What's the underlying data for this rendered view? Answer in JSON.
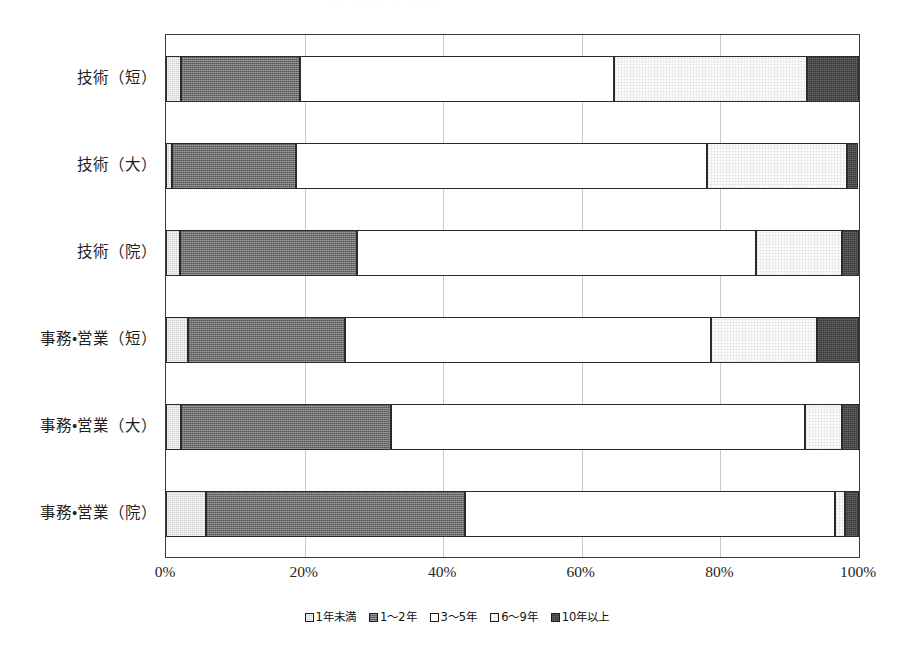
{
  "scan_artifact_text": "· · ·   ·· ·  ·· · ·· ·",
  "chart_data": {
    "type": "bar",
    "orientation": "horizontal",
    "stacked": true,
    "title": "",
    "subtitle": "",
    "xlabel": "",
    "ylabel": "",
    "xlim": [
      0,
      100
    ],
    "xtick_labels": [
      "0%",
      "20%",
      "40%",
      "60%",
      "80%",
      "100%"
    ],
    "xtick_values": [
      0,
      20,
      40,
      60,
      80,
      100
    ],
    "grid": true,
    "grid_axis": "x",
    "legend_position": "bottom",
    "unit": "%",
    "categories": [
      "技術（短）",
      "技術（大）",
      "技術（院）",
      "事務・営業（短）",
      "事務・営業（大）",
      "事務・営業（院）"
    ],
    "series": [
      {
        "name": "1年未満",
        "pattern": "light-grey-speckle",
        "color": "#d2d2d2",
        "values": [
          2.2,
          0.8,
          2.0,
          3.2,
          2.2,
          5.8
        ]
      },
      {
        "name": "1〜2年",
        "pattern": "dark-grey-speckle",
        "color": "#6e6e6e",
        "values": [
          17.1,
          17.9,
          25.6,
          22.6,
          30.3,
          37.4
        ]
      },
      {
        "name": "3〜5年",
        "pattern": "white",
        "color": "#ffffff",
        "values": [
          45.3,
          59.4,
          57.6,
          52.9,
          59.7,
          53.4
        ]
      },
      {
        "name": "6〜9年",
        "pattern": "dotted-near-white",
        "color": "#fbfbfb",
        "values": [
          27.9,
          20.1,
          12.4,
          15.3,
          5.4,
          1.4
        ]
      },
      {
        "name": "10年以上",
        "pattern": "near-black-speckle",
        "color": "#343434",
        "values": [
          7.5,
          1.7,
          2.4,
          6.0,
          2.4,
          2.0
        ]
      }
    ]
  },
  "axis": {
    "x_ticks": [
      {
        "label": "0%",
        "value": 0
      },
      {
        "label": "20%",
        "value": 20
      },
      {
        "label": "40%",
        "value": 40
      },
      {
        "label": "60%",
        "value": 60
      },
      {
        "label": "80%",
        "value": 80
      },
      {
        "label": "100%",
        "value": 100
      }
    ]
  },
  "legend": {
    "items": [
      {
        "label": "1年未満",
        "swatch": "light-grey-speckle"
      },
      {
        "label": "1〜2年",
        "swatch": "dark-grey-speckle"
      },
      {
        "label": "3〜5年",
        "swatch": "white"
      },
      {
        "label": "6〜9年",
        "swatch": "dotted-near-white"
      },
      {
        "label": "10年以上",
        "swatch": "near-black-speckle"
      }
    ]
  }
}
